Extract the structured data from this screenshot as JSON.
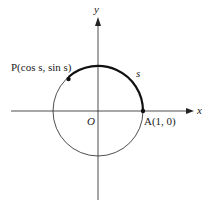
{
  "diagram": {
    "axes": {
      "x_label": "x",
      "y_label": "y",
      "origin_label": "O"
    },
    "points": [
      {
        "id": "P",
        "label": "P(cos s, sin s)"
      },
      {
        "id": "A",
        "label": "A(1, 0)"
      }
    ],
    "arc_label": "s",
    "colors": {
      "stroke": "#222222",
      "background": "#ffffff"
    }
  }
}
